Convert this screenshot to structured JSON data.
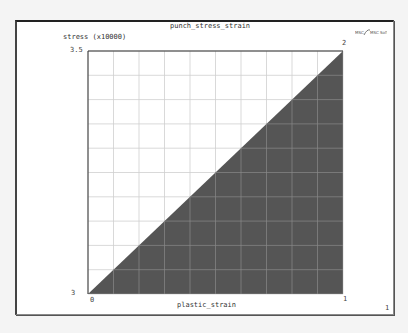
{
  "chart_data": {
    "type": "area",
    "title": "punch_stress_strain",
    "xlabel": "plastic_strain",
    "ylabel": "stress (x10000)",
    "x": [
      0,
      1
    ],
    "series": [
      {
        "name": "punch_stress_strain",
        "values": [
          0,
          3.5
        ],
        "fill": "#555555"
      }
    ],
    "xlim": [
      0,
      1
    ],
    "ylim": [
      0,
      3.5
    ],
    "x_tick_labels": [
      "0",
      "1"
    ],
    "y_tick_labels": [
      "3",
      "3.5"
    ],
    "point_labels": [
      "2"
    ],
    "grid": true,
    "grid_divisions": {
      "x": 10,
      "y": 10
    },
    "legend": "none"
  },
  "chart": {
    "title": "punch_stress_strain",
    "xlabel": "plastic_strain",
    "ylabel": "stress (x10000)",
    "y_max_label": "3.5",
    "y_min_label": "3",
    "x_min_label": "0",
    "x_max_label": "1",
    "endpoint_label": "2",
    "page_number": "1",
    "logo_text": "MSC Software"
  },
  "colors": {
    "fill": "#555555",
    "grid_light": "#cfcfcf",
    "grid_dark": "#8a8a8a",
    "axis": "#333333",
    "background": "#ffffff"
  }
}
